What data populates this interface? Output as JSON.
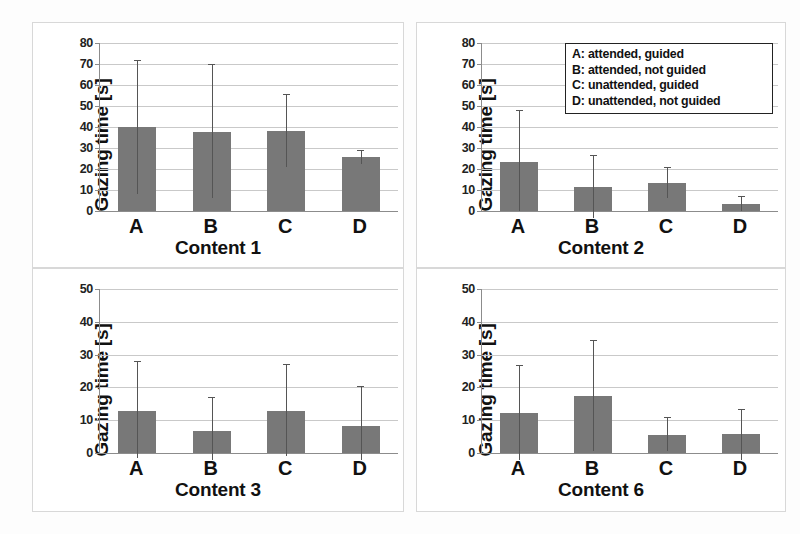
{
  "figure": {
    "ylabel": "Gazing time [s]",
    "legend": {
      "entries": [
        "A: attended, guided",
        "B: attended, not guided",
        "C: unattended, guided",
        "D: unattended, not guided"
      ],
      "position": "top-right of Content 2 panel"
    },
    "colors": {
      "bar_fill": "#787878",
      "error_bar": "#555555",
      "gridline": "#c9c9c9",
      "axis": "#8c8c8c",
      "panel_border": "#d8d8d8",
      "text": "#111111",
      "background": "#ffffff"
    }
  },
  "chart_data": [
    {
      "type": "bar",
      "title": "Content 1",
      "xlabel": "Content 1",
      "ylabel": "Gazing time [s]",
      "categories": [
        "A",
        "B",
        "C",
        "D"
      ],
      "values": [
        40.2,
        37.5,
        38.2,
        25.8
      ],
      "error_high": [
        72.0,
        70.0,
        55.5,
        29.0
      ],
      "error_low": [
        8.0,
        6.0,
        21.0,
        22.5
      ],
      "ylim": [
        0,
        80
      ],
      "yticks": [
        0,
        10,
        20,
        30,
        40,
        50,
        60,
        70,
        80
      ],
      "ytick_labels": [
        "0",
        "10",
        "20",
        "30",
        "40",
        "50",
        "60",
        "70",
        "80"
      ],
      "grid": true,
      "legend": false
    },
    {
      "type": "bar",
      "title": "Content 2",
      "xlabel": "Content 2",
      "ylabel": "Gazing time [s]",
      "categories": [
        "A",
        "B",
        "C",
        "D"
      ],
      "values": [
        23.2,
        11.5,
        13.5,
        3.4
      ],
      "error_high": [
        48.0,
        26.5,
        21.0,
        7.0
      ],
      "error_low": [
        0.0,
        -3.5,
        6.0,
        0.0
      ],
      "ylim": [
        0,
        80
      ],
      "yticks": [
        0,
        10,
        20,
        30,
        40,
        50,
        60,
        70,
        80
      ],
      "ytick_labels": [
        "0",
        "10",
        "20",
        "30",
        "40",
        "50",
        "60",
        "70",
        "80"
      ],
      "grid": true,
      "legend": true
    },
    {
      "type": "bar",
      "title": "Content 3",
      "xlabel": "Content 3",
      "ylabel": "Gazing time [s]",
      "categories": [
        "A",
        "B",
        "C",
        "D"
      ],
      "values": [
        12.9,
        6.7,
        12.8,
        8.3
      ],
      "error_high": [
        28.0,
        17.2,
        27.2,
        20.3
      ],
      "error_low": [
        -1.5,
        -2.0,
        -1.0,
        -2.0
      ],
      "ylim": [
        0,
        50
      ],
      "yticks": [
        0,
        10,
        20,
        30,
        40,
        50
      ],
      "ytick_labels": [
        "0",
        "10",
        "20",
        "30",
        "40",
        "50"
      ],
      "grid": true,
      "legend": false
    },
    {
      "type": "bar",
      "title": "Content 6",
      "xlabel": "Content 6",
      "ylabel": "Gazing time [s]",
      "categories": [
        "A",
        "B",
        "C",
        "D"
      ],
      "values": [
        12.3,
        17.3,
        5.6,
        5.7
      ],
      "error_high": [
        26.8,
        34.5,
        11.0,
        13.5
      ],
      "error_low": [
        -2.0,
        0.5,
        0.5,
        -2.0
      ],
      "ylim": [
        0,
        50
      ],
      "yticks": [
        0,
        10,
        20,
        30,
        40,
        50
      ],
      "ytick_labels": [
        "0",
        "10",
        "20",
        "30",
        "40",
        "50"
      ],
      "grid": true,
      "legend": false
    }
  ]
}
